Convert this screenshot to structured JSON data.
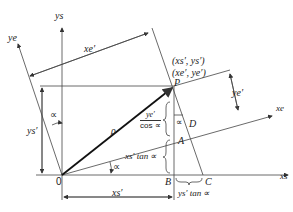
{
  "diagram": {
    "type": "coordinate-rotation",
    "axes": {
      "ys": "ys",
      "xs": "xs",
      "ye": "ye",
      "xe": "xe"
    },
    "points": {
      "origin": "0",
      "P": "P",
      "A": "A",
      "B": "B",
      "C": "C",
      "D": "D"
    },
    "coords": {
      "line1": "(xs′, ys′)",
      "line2": "(xe′, ye′)"
    },
    "dimensions": {
      "xe_prime": "xe′",
      "ye_prime": "ye′",
      "ys_prime": "ys′",
      "xs_prime": "xs′",
      "rho": "ρ",
      "ye_over_cos_num": "ye′",
      "ye_over_cos_den": "cos ∝",
      "xs_tan": "xs′ tan ∝",
      "ys_tan": "ys′ tan ∝"
    },
    "angles": {
      "alpha_top": "∝",
      "alpha_bottom": "∝",
      "alpha_D": "∝"
    },
    "colors": {
      "line": "#333333",
      "background": "#ffffff"
    }
  }
}
